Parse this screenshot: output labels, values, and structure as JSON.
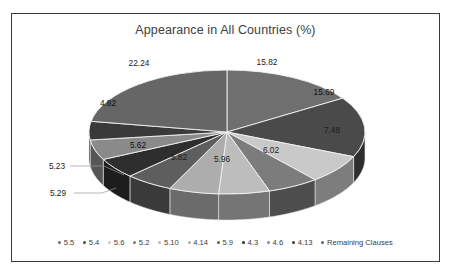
{
  "chart_data": {
    "type": "pie",
    "title": "Appearance in All Countries (%)",
    "xlabel": "",
    "ylabel": "",
    "legend_position": "bottom",
    "grid": false,
    "three_d": true,
    "categories": [
      "5.5",
      "5.4",
      "5.6",
      "5.2",
      "5.10",
      "4.14",
      "5.9",
      "4.3",
      "4.6",
      "4.13",
      "Remaining Clauses"
    ],
    "values": [
      15.82,
      15.69,
      7.48,
      6.02,
      5.96,
      5.82,
      5.62,
      5.29,
      5.23,
      4.82,
      22.24
    ],
    "labels": [
      "15.82",
      "15.69",
      "7.48",
      "6.02",
      "5.96",
      "5.82",
      "5.62",
      "5.29",
      "5.23",
      "4.82",
      "22.24"
    ],
    "colors": [
      "#6f6f6f",
      "#4a4a4a",
      "#c9c9c9",
      "#7c7c7c",
      "#bdbdbd",
      "#adadad",
      "#5e5e5e",
      "#2e2e2e",
      "#8a8a8a",
      "#3a3a3a",
      "#666666"
    ],
    "label_placement": [
      "inside",
      "inside",
      "inside",
      "inside",
      "inside",
      "inside",
      "inside",
      "outside",
      "outside",
      "inside",
      "inside"
    ]
  },
  "frame": {
    "border_color": "#3a3a3a",
    "background": "#ffffff"
  },
  "slice_labels": {
    "s0": "15.82",
    "s1": "15.69",
    "s2": "7.48",
    "s3": "6.02",
    "s4": "5.96",
    "s5": "5.82",
    "s6": "5.62",
    "s7": "5.29",
    "s8": "5.23",
    "s9": "4.82",
    "s10": "22.24"
  },
  "legend": {
    "items": [
      {
        "label": "5.5",
        "color": "#6f6f6f"
      },
      {
        "label": "5.4",
        "color": "#4a4a4a"
      },
      {
        "label": "5.6",
        "color": "#c9c9c9"
      },
      {
        "label": "5.2",
        "color": "#7c7c7c"
      },
      {
        "label": "5.10",
        "color": "#bdbdbd"
      },
      {
        "label": "4.14",
        "color": "#adadad"
      },
      {
        "label": "5.9",
        "color": "#5e5e5e"
      },
      {
        "label": "4.3",
        "color": "#2e2e2e"
      },
      {
        "label": "4.6",
        "color": "#8a8a8a"
      },
      {
        "label": "4.13",
        "color": "#3a3a3a"
      },
      {
        "label": "Remaining Clauses",
        "color": "#666666"
      }
    ]
  }
}
